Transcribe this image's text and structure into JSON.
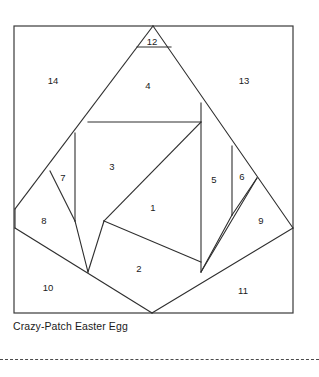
{
  "figure": {
    "caption": "Crazy-Patch Easter Egg",
    "frame": {
      "x": 14,
      "y": 26,
      "width": 279,
      "height": 287
    },
    "line_color": "#2e2e2e",
    "frame_color": "#3a3a3a",
    "background_color": "#ffffff",
    "cut_line_style": "dashed"
  },
  "pieces": [
    {
      "number": "1",
      "label_x": 153,
      "label_y": 208
    },
    {
      "number": "2",
      "label_x": 139,
      "label_y": 269
    },
    {
      "number": "3",
      "label_x": 112,
      "label_y": 167
    },
    {
      "number": "4",
      "label_x": 148,
      "label_y": 86
    },
    {
      "number": "5",
      "label_x": 214,
      "label_y": 180
    },
    {
      "number": "6",
      "label_x": 242,
      "label_y": 177
    },
    {
      "number": "7",
      "label_x": 63,
      "label_y": 178
    },
    {
      "number": "8",
      "label_x": 44,
      "label_y": 221
    },
    {
      "number": "9",
      "label_x": 261,
      "label_y": 221
    },
    {
      "number": "10",
      "label_x": 48,
      "label_y": 288
    },
    {
      "number": "11",
      "label_x": 243,
      "label_y": 291
    },
    {
      "number": "12",
      "label_x": 152,
      "label_y": 42
    },
    {
      "number": "13",
      "label_x": 244,
      "label_y": 81
    },
    {
      "number": "14",
      "label_x": 53,
      "label_y": 81
    }
  ],
  "seams": [
    {
      "name": "egg-left-upper-edge",
      "points": "153,26 15,209"
    },
    {
      "name": "egg-right-upper-edge",
      "points": "153,26 293,228"
    },
    {
      "name": "egg-left-lower-edge",
      "points": "15,228 152,313"
    },
    {
      "name": "egg-right-lower-edge",
      "points": "293,228 152,313"
    },
    {
      "name": "egg-left-side-edge",
      "points": "15,209 15,228"
    },
    {
      "name": "piece12-base",
      "points": "137,47 171,47"
    },
    {
      "name": "piece3-4-divider",
      "points": "88,122 201,122"
    },
    {
      "name": "piece4-5-vertical",
      "points": "201,103 201,272"
    },
    {
      "name": "piece7-right-vertical",
      "points": "75,133 75,221"
    },
    {
      "name": "piece7-hypotenuse",
      "points": "50,171 75,221"
    },
    {
      "name": "piece6-left-vertical",
      "points": "232,146 232,215"
    },
    {
      "name": "piece6-hypotenuse",
      "points": "257,178 232,215"
    },
    {
      "name": "piece1-upper-left",
      "points": "201,122 104,221"
    },
    {
      "name": "piece1-lower-left",
      "points": "104,221 201,262"
    },
    {
      "name": "piece2-left",
      "points": "104,221 88,272"
    },
    {
      "name": "piece3-bottom",
      "points": "75,221 88,272"
    },
    {
      "name": "piece11-left",
      "points": "201,272 232,215"
    },
    {
      "name": "piece9-left",
      "points": "201,272 257,178"
    }
  ]
}
